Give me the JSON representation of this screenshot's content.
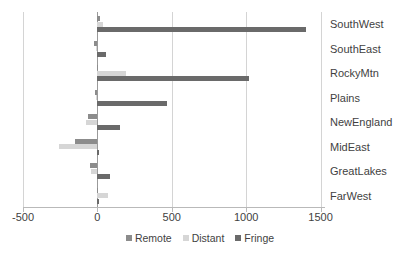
{
  "chart_data": {
    "type": "bar",
    "orientation": "horizontal",
    "title": "",
    "xlabel": "",
    "ylabel": "",
    "categories": [
      "SouthWest",
      "SouthEast",
      "RockyMtn",
      "Plains",
      "NewEngland",
      "MidEast",
      "GreatLakes",
      "FarWest"
    ],
    "series": [
      {
        "name": "Remote",
        "color": "#8c8c8c",
        "values": [
          20,
          -25,
          5,
          -15,
          -60,
          -150,
          -50,
          -5
        ]
      },
      {
        "name": "Distant",
        "color": "#d6d6d6",
        "values": [
          35,
          -10,
          190,
          -10,
          -75,
          -260,
          -45,
          70
        ]
      },
      {
        "name": "Fringe",
        "color": "#6a6a6a",
        "values": [
          1400,
          60,
          1020,
          470,
          150,
          10,
          85,
          8
        ]
      }
    ],
    "xticks": [
      -500,
      0,
      500,
      1000,
      1500
    ],
    "xlim": [
      -500,
      1530
    ],
    "grid": true,
    "gridlines_at": [
      -500,
      500,
      1000,
      1500
    ],
    "legend_position": "bottom",
    "legend_entries": [
      "Remote",
      "Distant",
      "Fringe"
    ]
  },
  "axis": {
    "tick_labels": [
      "-500",
      "0",
      "500",
      "1000",
      "1500"
    ]
  },
  "legend": {
    "items": [
      {
        "label": "Remote"
      },
      {
        "label": "Distant"
      },
      {
        "label": "Fringe"
      }
    ]
  }
}
